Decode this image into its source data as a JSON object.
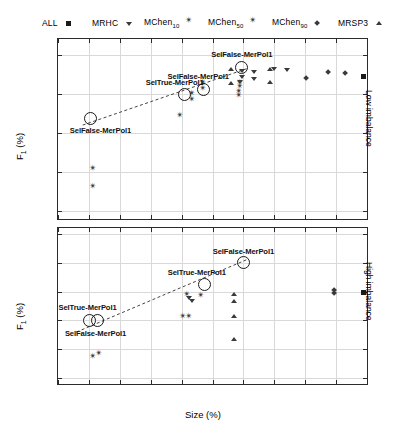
{
  "legend": {
    "items": [
      {
        "label": "ALL",
        "marker": "square",
        "sub": ""
      },
      {
        "label": "MRHC",
        "marker": "triangle-down",
        "sub": ""
      },
      {
        "label": "MChen",
        "marker": "star4",
        "sub": "10"
      },
      {
        "label": "MChen",
        "marker": "star4",
        "sub": "50"
      },
      {
        "label": "MChen",
        "marker": "diamond",
        "sub": "90"
      },
      {
        "label": "MRSP3",
        "marker": "triangle-up",
        "sub": ""
      }
    ]
  },
  "axes": {
    "x_title": "Size (%)",
    "y_title_main": "F",
    "y_title_sub": "1",
    "y_title_unit": " (%)",
    "x_ticks": [
      0,
      10,
      20,
      30,
      40,
      50,
      60,
      70,
      80,
      90,
      100
    ],
    "top_y_ticks": [
      25,
      30,
      35,
      40,
      45
    ],
    "bottom_y_ticks": [
      6,
      8,
      10,
      12,
      14,
      16
    ],
    "side_label_top": "Low imbalance",
    "side_label_bottom": "High imbalance"
  },
  "chart_data": [
    {
      "type": "scatter",
      "title": "Low imbalance",
      "xlabel": "Size (%)",
      "ylabel": "F1 (%)",
      "xlim": [
        0,
        100
      ],
      "ylim": [
        24,
        47
      ],
      "grid": true,
      "legend_position": "top",
      "series": [
        {
          "name": "ALL",
          "marker": "square",
          "points": [
            [
              99.0,
              42.3
            ]
          ]
        },
        {
          "name": "MRHC",
          "marker": "triangle-down",
          "points": [
            [
              59.5,
              43.0
            ],
            [
              59.5,
              42.2
            ],
            [
              59.0,
              41.6
            ],
            [
              63.5,
              42.9
            ],
            [
              63.5,
              41.9
            ],
            [
              70.0,
              43.2
            ],
            [
              74.0,
              43.1
            ]
          ]
        },
        {
          "name": "MChen10",
          "marker": "star4",
          "points": [
            [
              47.0,
              41.0
            ],
            [
              47.0,
              40.3
            ],
            [
              39.5,
              36.9
            ],
            [
              43.5,
              39.7
            ],
            [
              43.5,
              38.9
            ],
            [
              11.5,
              30.1
            ],
            [
              11.5,
              27.8
            ]
          ]
        },
        {
          "name": "MChen50",
          "marker": "star4",
          "points": [
            [
              59.0,
              41.1
            ],
            [
              59.0,
              40.6
            ],
            [
              58.8,
              39.9
            ],
            [
              58.8,
              39.4
            ]
          ]
        },
        {
          "name": "MChen90",
          "marker": "diamond",
          "points": [
            [
              80.5,
              42.0
            ],
            [
              87.5,
              42.7
            ],
            [
              93.0,
              42.6
            ]
          ]
        },
        {
          "name": "MRSP3",
          "marker": "triangle-up",
          "points": [
            [
              56.0,
              43.1
            ],
            [
              56.0,
              41.3
            ],
            [
              68.5,
              43.1
            ],
            [
              68.5,
              41.5
            ]
          ]
        }
      ],
      "highlighted": [
        {
          "label": "SelFalse-MerPol1",
          "x": 10.5,
          "y": 36.9,
          "label_dx": 10,
          "label_dy": 12
        },
        {
          "label": "SelFalse-MerPol1",
          "x": 47.0,
          "y": 40.6,
          "label_dx": -5,
          "label_dy": -13
        },
        {
          "label": "SelFalse-MerPol1",
          "x": 59.5,
          "y": 43.4,
          "label_dx": 0,
          "label_dy": -13
        },
        {
          "label": "SelTrue-MerPol1",
          "x": 41.0,
          "y": 39.9,
          "label_dx": -10,
          "label_dy": -13
        }
      ],
      "trend_line": [
        [
          8.0,
          36.0
        ],
        [
          61.0,
          43.2
        ]
      ]
    },
    {
      "type": "scatter",
      "title": "High imbalance",
      "xlabel": "Size (%)",
      "ylabel": "F1 (%)",
      "xlim": [
        0,
        100
      ],
      "ylim": [
        5.6,
        16.4
      ],
      "grid": true,
      "legend_position": "top",
      "series": [
        {
          "name": "ALL",
          "marker": "square",
          "points": [
            [
              99.0,
              12.0
            ]
          ]
        },
        {
          "name": "MRHC",
          "marker": "triangle-down",
          "points": [
            [
              42.5,
              11.6
            ],
            [
              43.5,
              11.4
            ]
          ]
        },
        {
          "name": "MChen10",
          "marker": "star4",
          "points": [
            [
              11.5,
              7.3
            ],
            [
              13.5,
              7.5
            ],
            [
              46.5,
              11.5
            ],
            [
              42.0,
              11.6
            ]
          ]
        },
        {
          "name": "MChen50",
          "marker": "star4",
          "points": [
            [
              40.5,
              10.1
            ],
            [
              42.5,
              10.1
            ]
          ]
        },
        {
          "name": "MChen90",
          "marker": "diamond",
          "points": [
            [
              89.5,
              12.1
            ],
            [
              89.5,
              11.9
            ]
          ]
        },
        {
          "name": "MRSP3",
          "marker": "triangle-up",
          "points": [
            [
              57.0,
              11.8
            ],
            [
              57.0,
              11.3
            ],
            [
              57.0,
              10.3
            ],
            [
              57.0,
              8.7
            ]
          ]
        }
      ],
      "highlighted": [
        {
          "label": "SelTrue-MerPol1",
          "x": 10.2,
          "y": 10.0,
          "label_dx": -2,
          "label_dy": -13
        },
        {
          "label": "SelFalse-MerPol1",
          "x": 12.8,
          "y": 10.0,
          "label_dx": -2,
          "label_dy": 13
        },
        {
          "label": "SelTrue-MerPol1",
          "x": 47.5,
          "y": 12.5,
          "label_dx": -8,
          "label_dy": -12
        },
        {
          "label": "SelFalse-MerPol1",
          "x": 60.0,
          "y": 14.0,
          "label_dx": 0,
          "label_dy": -12
        }
      ],
      "trend_line": [
        [
          6.0,
          9.2
        ],
        [
          61.0,
          14.2
        ]
      ]
    }
  ]
}
